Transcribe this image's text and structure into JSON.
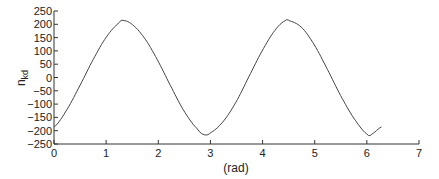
{
  "chart_data": {
    "type": "line",
    "title": "",
    "xlabel": "(rad)",
    "ylabel": "n_kd",
    "ylabel_main": "n",
    "ylabel_sub": "kd",
    "xlim": [
      0,
      7
    ],
    "ylim": [
      -250,
      250
    ],
    "grid": false,
    "legend": null,
    "x_ticks": [
      0,
      1,
      2,
      3,
      4,
      5,
      6,
      7
    ],
    "y_ticks": [
      250,
      200,
      150,
      100,
      50,
      0,
      -50,
      -100,
      -150,
      -200,
      -250
    ],
    "series": [
      {
        "name": "n_kd",
        "color": "#444444",
        "x": [
          0.0,
          0.25,
          0.5,
          0.75,
          1.0,
          1.25,
          1.31,
          1.5,
          1.75,
          2.0,
          2.25,
          2.5,
          2.75,
          2.88,
          3.0,
          3.25,
          3.5,
          3.75,
          4.0,
          4.25,
          4.45,
          4.5,
          4.75,
          5.0,
          5.25,
          5.5,
          5.75,
          6.02,
          6.1,
          6.28
        ],
        "y": [
          -186,
          -120,
          -29,
          67,
          151,
          205,
          215,
          199,
          144,
          60,
          -37,
          -128,
          -193,
          -215,
          -208,
          -164,
          -89,
          8,
          103,
          180,
          215,
          214,
          188,
          120,
          28,
          -69,
          -153,
          -215,
          -212,
          -186
        ]
      }
    ]
  }
}
